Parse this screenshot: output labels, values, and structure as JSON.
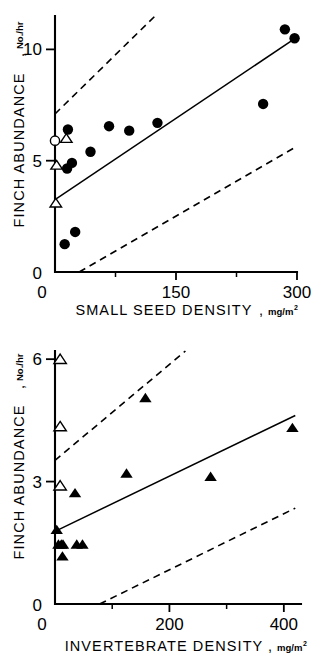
{
  "figure": {
    "background_color": "#ffffff",
    "ink_color": "#000000"
  },
  "panels": [
    {
      "id": "top",
      "name": "small-seed-density-panel"
    },
    {
      "id": "bottom",
      "name": "invertebrate-density-panel"
    }
  ],
  "chart_data": [
    {
      "type": "scatter",
      "title": "",
      "xlabel": "SMALL SEED DENSITY",
      "xlabel_unit": "mg/m",
      "xlabel_unit_exp": "2",
      "ylabel": "FINCH ABUNDANCE",
      "ylabel_unit": "No./hr",
      "ylabel_separator": ",",
      "xlabel_separator": ",",
      "xlim": [
        0,
        300
      ],
      "ylim": [
        0,
        11.5
      ],
      "xticks": [
        0,
        150,
        300
      ],
      "xticklabels": [
        "0",
        "150",
        "300"
      ],
      "xminorticks": [
        75,
        225
      ],
      "yticks": [
        5,
        10
      ],
      "yticklabels": [
        "5",
        "10"
      ],
      "y_origin_label": "0",
      "grid": false,
      "legend": false,
      "series": [
        {
          "name": "filled-circles",
          "marker": "filled-circle",
          "points": [
            {
              "x": 16,
              "y": 6.4
            },
            {
              "x": 15,
              "y": 4.65
            },
            {
              "x": 21,
              "y": 4.9
            },
            {
              "x": 12,
              "y": 1.25
            },
            {
              "x": 25,
              "y": 1.8
            },
            {
              "x": 44,
              "y": 5.4
            },
            {
              "x": 67,
              "y": 6.55
            },
            {
              "x": 92,
              "y": 6.35
            },
            {
              "x": 127,
              "y": 6.7
            },
            {
              "x": 258,
              "y": 7.55
            },
            {
              "x": 285,
              "y": 10.9
            },
            {
              "x": 297,
              "y": 10.5
            }
          ]
        },
        {
          "name": "open-circles",
          "marker": "open-circle",
          "points": [
            {
              "x": 0,
              "y": 5.9
            }
          ]
        },
        {
          "name": "open-triangles",
          "marker": "open-triangle",
          "points": [
            {
              "x": 14,
              "y": 6.0
            },
            {
              "x": 2,
              "y": 4.8
            },
            {
              "x": 1,
              "y": 3.1
            }
          ]
        }
      ],
      "fit_line": {
        "name": "regression-line",
        "style": "solid",
        "x_start": 0,
        "y_start": 3.25,
        "x_end": 300,
        "y_end": 10.55
      },
      "confidence_bands": [
        {
          "name": "upper-confidence-band",
          "style": "dashed",
          "x_start": 0,
          "y_start": 7.1,
          "x_end": 124,
          "y_end": 11.5
        },
        {
          "name": "lower-confidence-band",
          "style": "dashed",
          "x_start": 30,
          "y_start": 0.0,
          "x_end": 300,
          "y_end": 5.65
        }
      ]
    },
    {
      "type": "scatter",
      "title": "",
      "xlabel": "INVERTEBRATE DENSITY",
      "xlabel_unit": "mg/m",
      "xlabel_unit_exp": "2",
      "ylabel": "FINCH ABUNDANCE",
      "ylabel_unit": "No./hr",
      "ylabel_separator": ",",
      "xlabel_separator": ",",
      "xlim": [
        0,
        430
      ],
      "ylim": [
        0,
        6.2
      ],
      "xticks": [
        0,
        200,
        400
      ],
      "xticklabels": [
        "0",
        "200",
        "400"
      ],
      "xminorticks": [
        100,
        300
      ],
      "yticks": [
        3,
        6
      ],
      "yticklabels": [
        "3",
        "6"
      ],
      "y_origin_label": "0",
      "grid": false,
      "legend": false,
      "series": [
        {
          "name": "filled-triangles",
          "marker": "filled-triangle",
          "points": [
            {
              "x": 3,
              "y": 1.82
            },
            {
              "x": 6,
              "y": 1.46
            },
            {
              "x": 11,
              "y": 1.46
            },
            {
              "x": 14,
              "y": 1.46
            },
            {
              "x": 13,
              "y": 1.17
            },
            {
              "x": 38,
              "y": 1.46
            },
            {
              "x": 48,
              "y": 1.46
            },
            {
              "x": 35,
              "y": 2.72
            },
            {
              "x": 125,
              "y": 3.2
            },
            {
              "x": 158,
              "y": 5.05
            },
            {
              "x": 272,
              "y": 3.12
            },
            {
              "x": 415,
              "y": 4.32
            }
          ]
        },
        {
          "name": "open-triangles",
          "marker": "open-triangle",
          "points": [
            {
              "x": 9,
              "y": 6.0
            },
            {
              "x": 9,
              "y": 4.35
            },
            {
              "x": 9,
              "y": 2.9
            }
          ]
        }
      ],
      "fit_line": {
        "name": "regression-line",
        "style": "solid",
        "x_start": 0,
        "y_start": 1.78,
        "x_end": 420,
        "y_end": 4.62
      },
      "confidence_bands": [
        {
          "name": "upper-confidence-band",
          "style": "dashed",
          "x_start": 0,
          "y_start": 3.52,
          "x_end": 228,
          "y_end": 6.2
        },
        {
          "name": "lower-confidence-band",
          "style": "dashed",
          "x_start": 78,
          "y_start": 0.0,
          "x_end": 420,
          "y_end": 2.35
        }
      ]
    }
  ]
}
